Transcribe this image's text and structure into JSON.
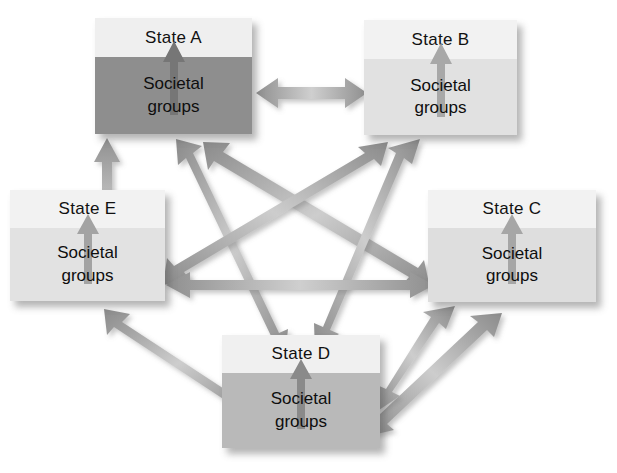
{
  "diagram": {
    "background_color": "#ffffff",
    "body_label_line1": "Societal",
    "body_label_line2": "groups",
    "arrow_color_light": "#c9c9c9",
    "arrow_color_dark": "#8d8d8d",
    "inner_arrow_color": "#9a9a9a",
    "inner_arrow_color_on_dark": "#6e6e6e",
    "nodes": [
      {
        "id": "A",
        "header_label": "State A",
        "body_line1": "Societal",
        "body_line2": "groups",
        "x": 95,
        "y": 18,
        "w": 157,
        "h": 116,
        "header_h": 39,
        "header_color": "#efefef",
        "body_color": "#8e8e8e",
        "inner_arrow_color": "#767676"
      },
      {
        "id": "B",
        "header_label": "State B",
        "body_line1": "Societal",
        "body_line2": "groups",
        "x": 364,
        "y": 20,
        "w": 153,
        "h": 115,
        "header_h": 39,
        "header_color": "#f2f2f2",
        "body_color": "#e1e1e1",
        "inner_arrow_color": "#a8a8a8"
      },
      {
        "id": "C",
        "header_label": "State C",
        "body_line1": "Societal",
        "body_line2": "groups",
        "x": 428,
        "y": 190,
        "w": 168,
        "h": 112,
        "header_h": 38,
        "header_color": "#f2f2f2",
        "body_color": "#dedede",
        "inner_arrow_color": "#a6a6a6"
      },
      {
        "id": "D",
        "header_label": "State D",
        "body_line1": "Societal",
        "body_line2": "groups",
        "x": 222,
        "y": 335,
        "w": 158,
        "h": 113,
        "header_h": 38,
        "header_color": "#f0f0f0",
        "body_color": "#b9b9b9",
        "inner_arrow_color": "#8a8a8a"
      },
      {
        "id": "E",
        "header_label": "State E",
        "body_line1": "Societal",
        "body_line2": "groups",
        "x": 10,
        "y": 190,
        "w": 155,
        "h": 111,
        "header_h": 38,
        "header_color": "#f2f2f2",
        "body_color": "#e2e2e2",
        "inner_arrow_color": "#a3a3a3"
      }
    ],
    "links": [
      {
        "id": "A-B",
        "from": "A",
        "to": "B",
        "kind": "double",
        "label": ""
      },
      {
        "id": "A-C",
        "from": "A",
        "to": "C",
        "kind": "double",
        "label": ""
      },
      {
        "id": "A-D",
        "from": "A",
        "to": "D",
        "kind": "double",
        "label": ""
      },
      {
        "id": "A-E",
        "from": "A",
        "to": "E",
        "kind": "double",
        "label": ""
      },
      {
        "id": "B-D",
        "from": "B",
        "to": "D",
        "kind": "double",
        "label": ""
      },
      {
        "id": "B-E",
        "from": "B",
        "to": "E",
        "kind": "double",
        "label": ""
      },
      {
        "id": "C-E",
        "from": "C",
        "to": "E",
        "kind": "double",
        "label": ""
      },
      {
        "id": "C-D",
        "from": "C",
        "to": "D",
        "kind": "double",
        "label": ""
      }
    ]
  }
}
